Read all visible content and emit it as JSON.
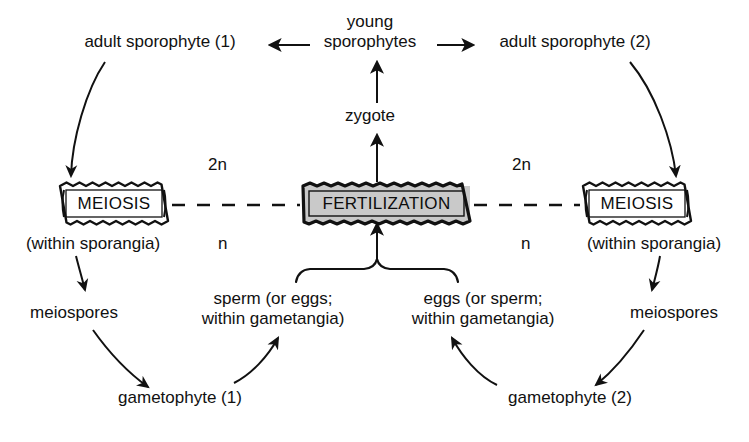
{
  "diagram": {
    "colors": {
      "ink": "#111111",
      "fertilization_fill": "#c9c9c9",
      "meiosis_fill": "#ffffff",
      "background": "#ffffff"
    },
    "labels": {
      "adult_sporophyte_1": "adult sporophyte (1)",
      "young_sporophytes_line1": "young",
      "young_sporophytes_line2": "sporophytes",
      "adult_sporophyte_2": "adult sporophyte (2)",
      "zygote": "zygote",
      "meiosis_left": "MEIOSIS",
      "meiosis_right": "MEIOSIS",
      "fertilization": "FERTILIZATION",
      "within_sporangia_left": "(within sporangia)",
      "within_sporangia_right": "(within sporangia)",
      "meiospores_left": "meiospores",
      "meiospores_right": "meiospores",
      "gametophyte_1": "gametophyte (1)",
      "gametophyte_2": "gametophyte (2)",
      "sperm_line1": "sperm (or eggs;",
      "sperm_line2": "within gametangia)",
      "eggs_line1": "eggs (or sperm;",
      "eggs_line2": "within gametangia)",
      "ploidy_2n_left": "2n",
      "ploidy_2n_right": "2n",
      "ploidy_n_left": "n",
      "ploidy_n_right": "n"
    }
  }
}
